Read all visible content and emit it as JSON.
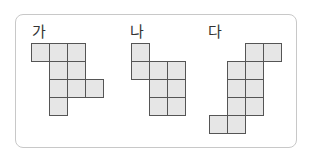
{
  "figures": [
    {
      "label": "가",
      "label_pos": [
        32,
        25
      ],
      "origin": [
        31,
        43
      ],
      "cells": [
        [
          0,
          0
        ],
        [
          1,
          0
        ],
        [
          2,
          0
        ],
        [
          1,
          1
        ],
        [
          2,
          1
        ],
        [
          1,
          2
        ],
        [
          2,
          2
        ],
        [
          3,
          2
        ],
        [
          1,
          3
        ]
      ]
    },
    {
      "label": "나",
      "label_pos": [
        130,
        25
      ],
      "origin": [
        131,
        43
      ],
      "cells": [
        [
          0,
          0
        ],
        [
          0,
          1
        ],
        [
          1,
          1
        ],
        [
          2,
          1
        ],
        [
          1,
          2
        ],
        [
          2,
          2
        ],
        [
          1,
          3
        ],
        [
          2,
          3
        ]
      ]
    },
    {
      "label": "다",
      "label_pos": [
        208,
        25
      ],
      "origin": [
        209,
        43
      ],
      "cells": [
        [
          2,
          0
        ],
        [
          3,
          0
        ],
        [
          1,
          1
        ],
        [
          2,
          1
        ],
        [
          1,
          2
        ],
        [
          2,
          2
        ],
        [
          1,
          3
        ],
        [
          2,
          3
        ],
        [
          0,
          4
        ],
        [
          1,
          4
        ]
      ]
    }
  ],
  "cell_size": 19,
  "colors": {
    "cell_fill": "#e6e6e6",
    "cell_border": "#555555",
    "frame_border": "#c8c8c8"
  }
}
